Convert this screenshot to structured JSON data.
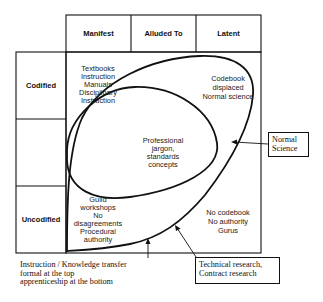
{
  "diagram": {
    "columns": [
      {
        "label": "Manifest"
      },
      {
        "label": "Alluded To"
      },
      {
        "label": "Latent"
      }
    ],
    "rows": [
      {
        "label": "Codified"
      },
      {
        "label": ""
      },
      {
        "label": "Uncodified"
      }
    ],
    "regions": {
      "codified_manifest": {
        "lines": [
          "Textbooks",
          "Instruction",
          "Manuals",
          "Disciplinary",
          "Instruction"
        ]
      },
      "codified_latent": {
        "lines": [
          "Codebook",
          "displaced",
          "Normal science"
        ]
      },
      "center": {
        "lines": [
          "Professional",
          "jargon,",
          "standards",
          "concepts"
        ]
      },
      "uncodified_manifest": {
        "lines": [
          "Guild",
          "workshops",
          "No",
          "disagreements",
          "Procedural",
          "authority"
        ]
      },
      "uncodified_latent": {
        "lines": [
          "No codebook",
          "No authority",
          "Gurus"
        ]
      }
    },
    "callouts": {
      "normal_science": {
        "lines": [
          "Normal",
          "Science"
        ]
      },
      "technical_research": {
        "lines": [
          "Technical research,",
          "Contract research"
        ]
      }
    },
    "note": {
      "lines": [
        "Instruction / Knowledge transfer",
        "formal at the top",
        "apprenticeship at the bottom"
      ]
    },
    "colors": {
      "stroke": "#111111",
      "background": "#ffffff"
    }
  }
}
